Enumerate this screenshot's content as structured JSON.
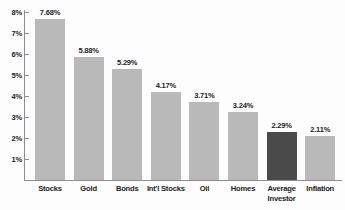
{
  "chart_data": {
    "type": "bar",
    "title": "",
    "xlabel": "",
    "ylabel": "",
    "categories": [
      "Stocks",
      "Gold",
      "Bonds",
      "Int'l Stocks",
      "Oil",
      "Homes",
      "Average\nInvestor",
      "Inflation"
    ],
    "values": [
      7.68,
      5.88,
      5.29,
      4.17,
      3.71,
      3.24,
      2.29,
      2.11
    ],
    "value_labels": [
      "7.68%",
      "5.88%",
      "5.29%",
      "4.17%",
      "3.71%",
      "3.24%",
      "2.29%",
      "2.11%"
    ],
    "ylim": [
      0,
      8
    ],
    "ytick_labels": [
      "8%",
      "7%",
      "6%",
      "5%",
      "4%",
      "3%",
      "2%",
      "1%"
    ],
    "ytick_values": [
      8,
      7,
      6,
      5,
      4,
      3,
      2,
      1
    ],
    "grid": false,
    "legend": "none",
    "highlight_index": 6,
    "colors": {
      "bar": "#b9b9b9",
      "bar_highlight": "#4a4a4a",
      "axis": "#8d8d8d",
      "text": "#1c1c1c",
      "background": "#fdfdfd"
    }
  }
}
